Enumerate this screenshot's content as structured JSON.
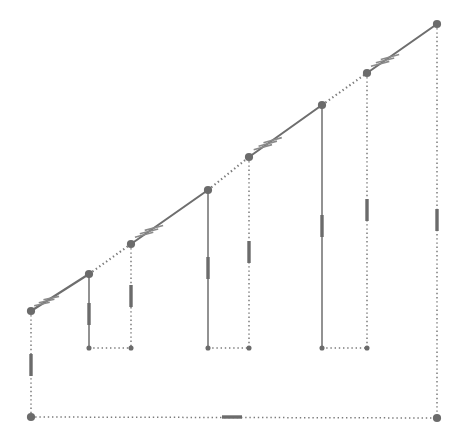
{
  "figure": {
    "canvas": {
      "width": 463,
      "height": 447,
      "background": "#ffffff"
    },
    "style": {
      "line_color": "#7b7b7b",
      "line_color_dark": "#6e6e6e",
      "node_color": "#6b6b6b",
      "tick_color": "#8a8a8a",
      "solid_width": 2.1,
      "dotted_width": 1.6,
      "vertical_width": 1.5,
      "node_radius": 4.1,
      "dash_pattern": "1.4 2.8"
    },
    "nodes": [
      {
        "name": "A",
        "x": 31,
        "y": 311,
        "type": "slope-vertex"
      },
      {
        "name": "B",
        "x": 89,
        "y": 274,
        "type": "slope-vertex"
      },
      {
        "name": "C",
        "x": 131,
        "y": 244,
        "type": "slope-vertex"
      },
      {
        "name": "D",
        "x": 208,
        "y": 190,
        "type": "slope-vertex"
      },
      {
        "name": "E",
        "x": 249,
        "y": 157,
        "type": "slope-vertex"
      },
      {
        "name": "F",
        "x": 322,
        "y": 105,
        "type": "slope-vertex"
      },
      {
        "name": "G",
        "x": 367,
        "y": 73,
        "type": "slope-vertex"
      },
      {
        "name": "H",
        "x": 437,
        "y": 24,
        "type": "slope-vertex"
      },
      {
        "name": "P",
        "x": 31,
        "y": 417,
        "type": "base-corner"
      },
      {
        "name": "Q",
        "x": 437,
        "y": 418,
        "type": "base-corner"
      },
      {
        "name": "b1",
        "x": 89,
        "y": 348,
        "type": "step-foot"
      },
      {
        "name": "b2",
        "x": 131,
        "y": 348,
        "type": "step-foot"
      },
      {
        "name": "b3",
        "x": 208,
        "y": 348,
        "type": "step-foot"
      },
      {
        "name": "b4",
        "x": 249,
        "y": 348,
        "type": "step-foot"
      },
      {
        "name": "b5",
        "x": 322,
        "y": 348,
        "type": "step-foot"
      },
      {
        "name": "b6",
        "x": 367,
        "y": 348,
        "type": "step-foot"
      }
    ],
    "slope_segments": [
      {
        "from": "A",
        "to": "B",
        "style": "solid"
      },
      {
        "from": "B",
        "to": "C",
        "style": "dotted"
      },
      {
        "from": "C",
        "to": "D",
        "style": "solid"
      },
      {
        "from": "D",
        "to": "E",
        "style": "dotted"
      },
      {
        "from": "E",
        "to": "F",
        "style": "solid"
      },
      {
        "from": "F",
        "to": "G",
        "style": "dotted"
      },
      {
        "from": "G",
        "to": "H",
        "style": "solid"
      }
    ],
    "vertical_segments": [
      {
        "from": "A",
        "to": "P",
        "style": "dotted"
      },
      {
        "from": "B",
        "to": "b1",
        "style": "solid"
      },
      {
        "from": "C",
        "to": "b2",
        "style": "dotted"
      },
      {
        "from": "D",
        "to": "b3",
        "style": "solid"
      },
      {
        "from": "E",
        "to": "b4",
        "style": "dotted"
      },
      {
        "from": "F",
        "to": "b5",
        "style": "solid"
      },
      {
        "from": "G",
        "to": "b6",
        "style": "dotted"
      },
      {
        "from": "H",
        "to": "Q",
        "style": "dotted"
      }
    ],
    "foot_segments": [
      {
        "from": "b1",
        "to": "b2",
        "style": "dotted"
      },
      {
        "from": "b3",
        "to": "b4",
        "style": "dotted"
      },
      {
        "from": "b5",
        "to": "b6",
        "style": "dotted"
      }
    ],
    "base_segments": [
      {
        "from": "P",
        "to": "Q",
        "style": "dotted"
      }
    ],
    "hatch_marks": [
      {
        "at_node": "A",
        "count": 3,
        "along": "A-B",
        "offset": 13,
        "spacing": 5.5,
        "length": 16,
        "angle_deg": 200
      },
      {
        "at_node": "C",
        "count": 3,
        "along": "C-D",
        "offset": 16,
        "spacing": 6.0,
        "length": 19,
        "angle_deg": 200
      },
      {
        "at_node": "E",
        "count": 3,
        "along": "E-F",
        "offset": 17,
        "spacing": 6.0,
        "length": 19,
        "angle_deg": 200
      },
      {
        "at_node": "G",
        "count": 3,
        "along": "G-H",
        "offset": 16,
        "spacing": 6.0,
        "length": 19,
        "angle_deg": 200
      }
    ],
    "segment_midpoint_marks": [
      {
        "on": "A-P",
        "x": 31,
        "y": 365,
        "orientation": "vertical",
        "length": 22,
        "thickness": 3.4
      },
      {
        "on": "B-b1",
        "x": 89,
        "y": 314,
        "orientation": "vertical",
        "length": 22,
        "thickness": 3.4
      },
      {
        "on": "C-b2",
        "x": 131,
        "y": 296,
        "orientation": "vertical",
        "length": 22,
        "thickness": 3.4
      },
      {
        "on": "D-b3",
        "x": 208,
        "y": 268,
        "orientation": "vertical",
        "length": 22,
        "thickness": 3.4
      },
      {
        "on": "E-b4",
        "x": 249,
        "y": 252,
        "orientation": "vertical",
        "length": 22,
        "thickness": 3.4
      },
      {
        "on": "F-b5",
        "x": 322,
        "y": 226,
        "orientation": "vertical",
        "length": 22,
        "thickness": 3.4
      },
      {
        "on": "G-b6",
        "x": 367,
        "y": 210,
        "orientation": "vertical",
        "length": 22,
        "thickness": 3.4
      },
      {
        "on": "H-Q",
        "x": 437,
        "y": 220,
        "orientation": "vertical",
        "length": 22,
        "thickness": 3.4
      },
      {
        "on": "P-Q",
        "x": 232,
        "y": 417,
        "orientation": "horizontal",
        "length": 20,
        "thickness": 3.4
      }
    ]
  }
}
